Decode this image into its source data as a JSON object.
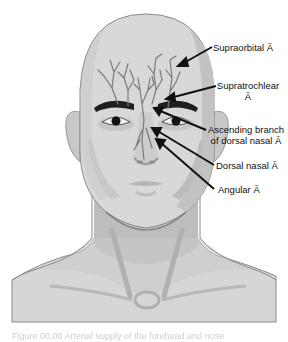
{
  "figure": {
    "subject": "Arterial supply of the forehead and nose",
    "labels": [
      {
        "id": "supraorbital",
        "text": "Supraorbital Ã"
      },
      {
        "id": "supratrochlear",
        "line1": "Supratrochlear",
        "line2": "Ã"
      },
      {
        "id": "ascending-branch",
        "line1": "Ascending branch",
        "line2": "of dorsal nasal Ã"
      },
      {
        "id": "dorsal-nasal",
        "text": "Dorsal nasal Ã"
      },
      {
        "id": "angular",
        "text": "Angular Ã"
      }
    ],
    "caption": "Figure 00.00 Arterial supply of the forehead and nose"
  },
  "colors": {
    "skin_light": "#d9d9d9",
    "skin_mid": "#c4c4c4",
    "skin_shadow": "#b3b3b3",
    "outline": "#8a8a8a",
    "vessel": "#7a7a7a",
    "dark": "#1a1a1a",
    "background": "#ffffff"
  }
}
